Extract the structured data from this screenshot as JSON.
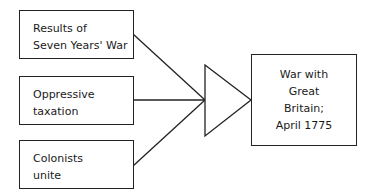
{
  "diagram": {
    "type": "cause-effect",
    "causes": [
      {
        "lines": [
          "Results of",
          "Seven Years' War"
        ]
      },
      {
        "lines": [
          "Oppressive",
          "taxation"
        ]
      },
      {
        "lines": [
          "Colonists",
          "unite"
        ]
      }
    ],
    "effect": {
      "lines": [
        "War with",
        "Great",
        "Britain;",
        "April 1775"
      ]
    },
    "colors": {
      "stroke": "#222222",
      "background": "#ffffff",
      "text": "#1a1a1a"
    }
  }
}
